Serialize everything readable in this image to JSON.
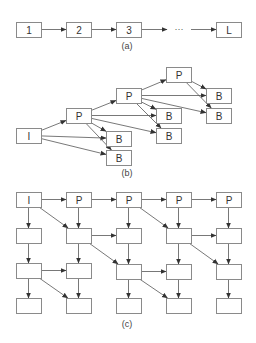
{
  "figure": {
    "panels": [
      {
        "id": "a",
        "caption": "(a)",
        "caption_pos": [
          127,
          46
        ],
        "nodes": [
          {
            "id": "a1",
            "label": "1",
            "x": 16,
            "y": 22,
            "w": 25,
            "h": 15
          },
          {
            "id": "a2",
            "label": "2",
            "x": 66,
            "y": 22,
            "w": 25,
            "h": 15
          },
          {
            "id": "a3",
            "label": "3",
            "x": 116,
            "y": 22,
            "w": 25,
            "h": 15
          },
          {
            "id": "aL",
            "label": "L",
            "x": 216,
            "y": 22,
            "w": 25,
            "h": 15
          }
        ],
        "edges": [
          [
            "a1",
            "a2"
          ],
          [
            "a2",
            "a3"
          ]
        ],
        "free_edges": [
          {
            "x1": 141,
            "y1": 29.5,
            "x2": 167,
            "y2": 29.5
          },
          {
            "x1": 191,
            "y1": 29.5,
            "x2": 216,
            "y2": 29.5
          }
        ],
        "ellipsis": {
          "text": "···",
          "x": 179,
          "y": 29
        }
      },
      {
        "id": "b",
        "caption": "(b)",
        "caption_pos": [
          127,
          173
        ],
        "nodes": [
          {
            "id": "bI",
            "label": "I",
            "x": 16,
            "y": 128,
            "w": 25,
            "h": 15
          },
          {
            "id": "bP1",
            "label": "P",
            "x": 66,
            "y": 108,
            "w": 25,
            "h": 15
          },
          {
            "id": "bP2",
            "label": "P",
            "x": 116,
            "y": 88,
            "w": 25,
            "h": 15
          },
          {
            "id": "bP3",
            "label": "P",
            "x": 166,
            "y": 67,
            "w": 25,
            "h": 15
          },
          {
            "id": "bB1",
            "label": "B",
            "x": 106,
            "y": 131,
            "w": 25,
            "h": 15
          },
          {
            "id": "bB2",
            "label": "B",
            "x": 106,
            "y": 150,
            "w": 25,
            "h": 15
          },
          {
            "id": "bB3",
            "label": "B",
            "x": 156,
            "y": 108,
            "w": 25,
            "h": 15
          },
          {
            "id": "bB4",
            "label": "B",
            "x": 156,
            "y": 128,
            "w": 25,
            "h": 15
          },
          {
            "id": "bB5",
            "label": "B",
            "x": 206,
            "y": 88,
            "w": 25,
            "h": 15
          },
          {
            "id": "bB6",
            "label": "B",
            "x": 206,
            "y": 108,
            "w": 25,
            "h": 15
          }
        ],
        "edges": [
          [
            "bI",
            "bP1"
          ],
          [
            "bI",
            "bB1"
          ],
          [
            "bI",
            "bB2"
          ],
          [
            "bP1",
            "bP2"
          ],
          [
            "bP1",
            "bB1"
          ],
          [
            "bP1",
            "bB2"
          ],
          [
            "bP1",
            "bB3"
          ],
          [
            "bP1",
            "bB4"
          ],
          [
            "bP2",
            "bP3"
          ],
          [
            "bP2",
            "bB3"
          ],
          [
            "bP2",
            "bB4"
          ],
          [
            "bP2",
            "bB5"
          ],
          [
            "bP2",
            "bB6"
          ],
          [
            "bP3",
            "bB5"
          ],
          [
            "bP3",
            "bB6"
          ]
        ]
      },
      {
        "id": "c",
        "caption": "(c)",
        "caption_pos": [
          127,
          324
        ],
        "nodes": [
          {
            "id": "c11",
            "label": "I",
            "x": 16,
            "y": 192,
            "w": 25,
            "h": 15
          },
          {
            "id": "c12",
            "label": "P",
            "x": 66,
            "y": 192,
            "w": 25,
            "h": 15
          },
          {
            "id": "c13",
            "label": "P",
            "x": 116,
            "y": 192,
            "w": 25,
            "h": 15
          },
          {
            "id": "c14",
            "label": "P",
            "x": 166,
            "y": 192,
            "w": 25,
            "h": 15
          },
          {
            "id": "c15",
            "label": "P",
            "x": 216,
            "y": 192,
            "w": 25,
            "h": 15
          },
          {
            "id": "c21",
            "label": "",
            "x": 16,
            "y": 228,
            "w": 25,
            "h": 15
          },
          {
            "id": "c22",
            "label": "",
            "x": 66,
            "y": 228,
            "w": 25,
            "h": 15
          },
          {
            "id": "c23",
            "label": "",
            "x": 116,
            "y": 228,
            "w": 25,
            "h": 15
          },
          {
            "id": "c24",
            "label": "",
            "x": 166,
            "y": 228,
            "w": 25,
            "h": 15
          },
          {
            "id": "c25",
            "label": "",
            "x": 216,
            "y": 228,
            "w": 25,
            "h": 15
          },
          {
            "id": "c31",
            "label": "",
            "x": 16,
            "y": 263,
            "w": 25,
            "h": 15
          },
          {
            "id": "c32",
            "label": "",
            "x": 66,
            "y": 263,
            "w": 25,
            "h": 15
          },
          {
            "id": "c33",
            "label": "",
            "x": 116,
            "y": 264,
            "w": 25,
            "h": 15
          },
          {
            "id": "c34",
            "label": "",
            "x": 166,
            "y": 264,
            "w": 25,
            "h": 15
          },
          {
            "id": "c35",
            "label": "",
            "x": 216,
            "y": 264,
            "w": 25,
            "h": 15
          },
          {
            "id": "c41",
            "label": "",
            "x": 16,
            "y": 298,
            "w": 25,
            "h": 15
          },
          {
            "id": "c42",
            "label": "",
            "x": 66,
            "y": 298,
            "w": 25,
            "h": 15
          },
          {
            "id": "c43",
            "label": "",
            "x": 116,
            "y": 298,
            "w": 25,
            "h": 15
          },
          {
            "id": "c44",
            "label": "",
            "x": 166,
            "y": 298,
            "w": 25,
            "h": 15
          },
          {
            "id": "c45",
            "label": "",
            "x": 216,
            "y": 298,
            "w": 25,
            "h": 15
          }
        ],
        "edges": [
          [
            "c11",
            "c12"
          ],
          [
            "c12",
            "c13"
          ],
          [
            "c13",
            "c14"
          ],
          [
            "c14",
            "c15"
          ],
          [
            "c11",
            "c21"
          ],
          [
            "c12",
            "c22"
          ],
          [
            "c13",
            "c23"
          ],
          [
            "c14",
            "c24"
          ],
          [
            "c15",
            "c25"
          ],
          [
            "c11",
            "c22"
          ],
          [
            "c13",
            "c24"
          ],
          [
            "c22",
            "c23"
          ],
          [
            "c24",
            "c25"
          ],
          [
            "c21",
            "c31"
          ],
          [
            "c22",
            "c32"
          ],
          [
            "c23",
            "c33"
          ],
          [
            "c24",
            "c34"
          ],
          [
            "c25",
            "c35"
          ],
          [
            "c22",
            "c33"
          ],
          [
            "c24",
            "c35"
          ],
          [
            "c31",
            "c32"
          ],
          [
            "c33",
            "c34"
          ],
          [
            "c31",
            "c41"
          ],
          [
            "c32",
            "c42"
          ],
          [
            "c33",
            "c43"
          ],
          [
            "c34",
            "c44"
          ],
          [
            "c35",
            "c45"
          ],
          [
            "c31",
            "c42"
          ],
          [
            "c33",
            "c44"
          ]
        ]
      }
    ]
  }
}
